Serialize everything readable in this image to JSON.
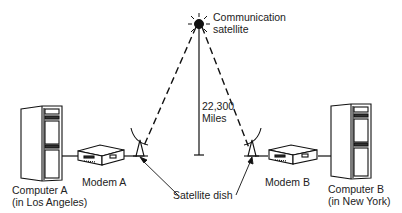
{
  "diagram": {
    "satellite": {
      "line1": "Communication",
      "line2": "satellite"
    },
    "distance": {
      "value": "22,300",
      "unit": "Miles"
    },
    "computer_a": {
      "line1": "Computer A",
      "line2": "(in Los Angeles)"
    },
    "computer_b": {
      "line1": "Computer B",
      "line2": "(in New York)"
    },
    "modem_a": "Modem A",
    "modem_b": "Modem B",
    "dish": "Satellite dish"
  }
}
